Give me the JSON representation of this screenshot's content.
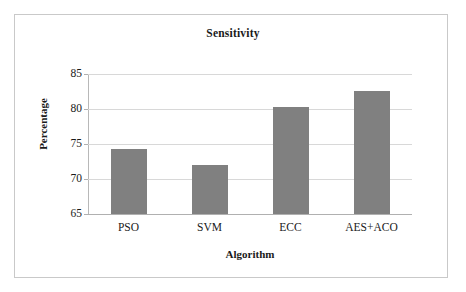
{
  "chart_data": {
    "type": "bar",
    "title": "Sensitivity",
    "xlabel": "Algorithm",
    "ylabel": "Percentage",
    "categories": [
      "PSO",
      "SVM",
      "ECC",
      "AES+ACO"
    ],
    "values": [
      74.3,
      72.0,
      80.3,
      82.6
    ],
    "series": [
      {
        "name": "Sensitivity",
        "values": [
          74.3,
          72.0,
          80.3,
          82.6
        ]
      }
    ],
    "ylim": [
      65,
      85
    ],
    "yticks": [
      65,
      70,
      75,
      80,
      85
    ],
    "ytick_labels": [
      "65",
      "70",
      "75",
      "80",
      "85"
    ],
    "grid": true,
    "legend": false,
    "legend_position": "none",
    "bar_color": "#808080",
    "gridline_color": "#d8d8d8",
    "axis_color": "#b0b0b0",
    "frame_color": "#c9c9c9",
    "background_color": "#ffffff"
  }
}
